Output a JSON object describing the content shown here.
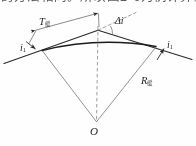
{
  "page": {
    "width": 196,
    "height": 146,
    "background": "#fefefe"
  },
  "top_text": {
    "content": "的方法相同。所以图2-6为例计算。",
    "note": "partially-cropped-chinese-text-line"
  },
  "figure": {
    "name": "vertical-curve-geometry-diagram",
    "caption": "",
    "colors": {
      "ink": "#262626",
      "line": "#3a3a3a",
      "thin_line": "#6a6a6a",
      "dashed": "#8a8a8a",
      "curve": "#1f1f1f"
    },
    "labels": {
      "tangent_length": {
        "symbol": "T",
        "subscript": "缓"
      },
      "grade_angle_change": {
        "symbol": "Δi",
        "subscript": ""
      },
      "grade_left": {
        "symbol": "i",
        "subscript": "1"
      },
      "grade_right": {
        "symbol": "i",
        "subscript": "1"
      },
      "radius": {
        "symbol": "R",
        "subscript": "缓"
      },
      "center": {
        "symbol": "O",
        "subscript": ""
      }
    },
    "geometry": {
      "apex": [
        98,
        30
      ],
      "left_tangent_point": [
        42,
        50
      ],
      "right_tangent_point": [
        156,
        46
      ],
      "center_O": [
        96,
        122
      ],
      "tangent_left_end": [
        6,
        62
      ],
      "tangent_right_end": [
        190,
        58
      ],
      "dashed_extension_end": [
        134,
        13
      ],
      "arc_sagitta_px": 6,
      "dimension_line": {
        "from": [
          32,
          30
        ],
        "to": [
          100,
          13
        ]
      }
    }
  }
}
